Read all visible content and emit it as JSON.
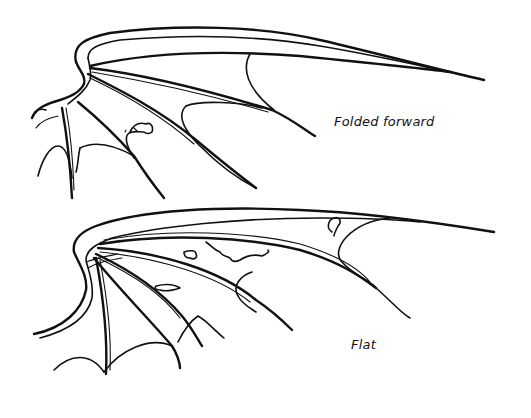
{
  "illustration": {
    "subject": "bat wing line drawings",
    "ink_color": "#111111",
    "background": "#ffffff",
    "figures": [
      {
        "id": "folded",
        "label": "Folded forward"
      },
      {
        "id": "flat",
        "label": "Flat"
      }
    ]
  }
}
